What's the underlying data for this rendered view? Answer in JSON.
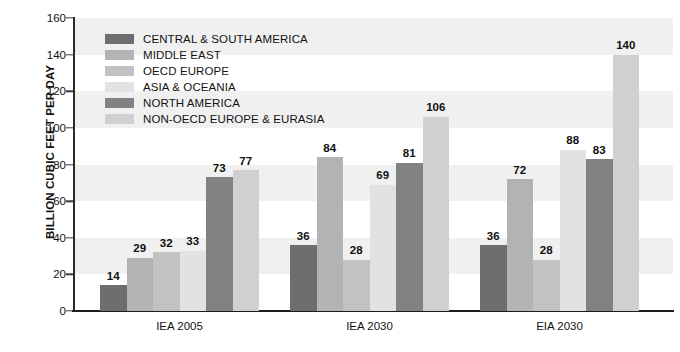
{
  "chart_data": {
    "type": "bar",
    "title": "",
    "xlabel": "",
    "ylabel": "BILLION CUBIC FEET PER DAY",
    "ylim": [
      0,
      160
    ],
    "ytick_step": 20,
    "yticks": [
      0,
      20,
      40,
      60,
      80,
      100,
      120,
      140,
      160
    ],
    "categories": [
      "IEA 2005",
      "IEA 2030",
      "EIA 2030"
    ],
    "grid": false,
    "background_bands": true,
    "legend_position": "upper-left-inside",
    "series": [
      {
        "name": "CENTRAL & SOUTH AMERICA",
        "color": "#6e6e6e",
        "values": [
          14,
          36,
          36
        ]
      },
      {
        "name": "MIDDLE EAST",
        "color": "#b3b3b3",
        "values": [
          29,
          84,
          72
        ]
      },
      {
        "name": "OECD EUROPE",
        "color": "#c2c2c2",
        "values": [
          32,
          28,
          28
        ]
      },
      {
        "name": "ASIA & OCEANIA",
        "color": "#e2e2e2",
        "values": [
          33,
          69,
          88
        ]
      },
      {
        "name": "NORTH AMERICA",
        "color": "#828282",
        "values": [
          73,
          81,
          83
        ]
      },
      {
        "name": "NON-OECD EUROPE & EURASIA",
        "color": "#d0d0d0",
        "values": [
          77,
          106,
          140
        ]
      }
    ]
  }
}
